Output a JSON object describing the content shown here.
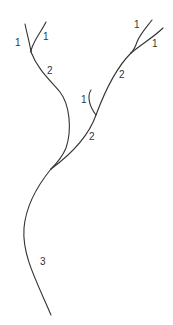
{
  "diagram": {
    "type": "stream-order-network",
    "labels": [
      {
        "id": "left-tip-a",
        "text": "1",
        "x": 15,
        "y": 46
      },
      {
        "id": "left-tip-b",
        "text": "1",
        "x": 43,
        "y": 40
      },
      {
        "id": "left-reach",
        "text": "2",
        "x": 47,
        "y": 74
      },
      {
        "id": "right-tip-a",
        "text": "1",
        "x": 134,
        "y": 28
      },
      {
        "id": "right-tip-b",
        "text": "1",
        "x": 152,
        "y": 47
      },
      {
        "id": "right-reach-upper",
        "text": "2",
        "x": 119,
        "y": 78
      },
      {
        "id": "small-tributary",
        "text": "1",
        "x": 81,
        "y": 103
      },
      {
        "id": "right-reach-lower",
        "text": "2",
        "x": 89,
        "y": 140
      },
      {
        "id": "main-reach",
        "text": "3",
        "x": 40,
        "y": 265
      }
    ]
  }
}
